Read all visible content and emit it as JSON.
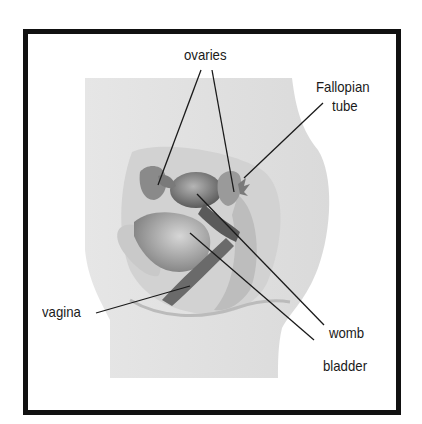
{
  "diagram": {
    "type": "anatomical-illustration",
    "labels": {
      "ovaries": "ovaries",
      "fallopian_tube_line1": "Fallopian",
      "fallopian_tube_line2": "tube",
      "vagina": "vagina",
      "womb": "womb",
      "bladder": "bladder"
    },
    "leader_lines": [
      {
        "label": "ovaries",
        "from": [
          201,
          70
        ],
        "to": [
          158,
          185
        ]
      },
      {
        "label": "ovaries",
        "from": [
          212,
          70
        ],
        "to": [
          234,
          192
        ]
      },
      {
        "label": "Fallopian tube",
        "from": [
          323,
          103
        ],
        "to": [
          244,
          178
        ]
      },
      {
        "label": "womb",
        "from": [
          197,
          194
        ],
        "to": [
          324,
          325
        ]
      },
      {
        "label": "bladder",
        "from": [
          190,
          233
        ],
        "to": [
          314,
          340
        ]
      },
      {
        "label": "vagina",
        "from": [
          96,
          313
        ],
        "to": [
          190,
          286
        ]
      }
    ],
    "colors": {
      "border": "#111111",
      "body_fill": "#e4e4e4",
      "organ_dark": "#6e6e6e",
      "organ_mid": "#9a9a9a",
      "line": "#1a1a1a"
    }
  }
}
